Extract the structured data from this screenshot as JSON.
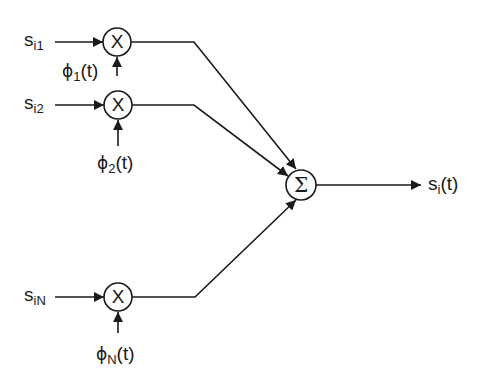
{
  "diagram": {
    "type": "signal-flow block diagram",
    "colors": {
      "stroke": "#1a1a1a",
      "background": "#ffffff"
    },
    "multipliers": [
      {
        "id": "mult-1",
        "symbol": "X",
        "input_label": {
          "base": "s",
          "sub": "i1"
        },
        "basis_label": {
          "base": "ϕ",
          "sub": "1",
          "suffix": "(t)"
        }
      },
      {
        "id": "mult-2",
        "symbol": "X",
        "input_label": {
          "base": "s",
          "sub": "i2"
        },
        "basis_label": {
          "base": "ϕ",
          "sub": "2",
          "suffix": "(t)"
        }
      },
      {
        "id": "mult-N",
        "symbol": "X",
        "input_label": {
          "base": "s",
          "sub": "iN"
        },
        "basis_label": {
          "base": "ϕ",
          "sub": "N",
          "suffix": "(t)"
        }
      }
    ],
    "summer": {
      "id": "sum",
      "symbol": "Σ"
    },
    "output_label": {
      "base": "s",
      "sub": "i",
      "suffix": "(t)"
    }
  }
}
